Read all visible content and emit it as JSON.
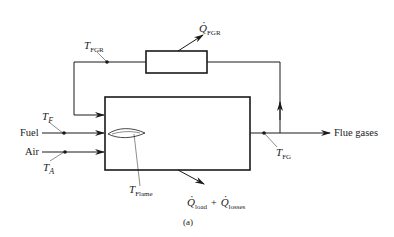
{
  "diagram": {
    "type": "process-flow",
    "caption": "(a)",
    "blocks": [
      {
        "id": "furnace",
        "label": ""
      },
      {
        "id": "fgr-heat-exchanger",
        "label": ""
      }
    ],
    "inputs": {
      "fuel": {
        "label": "Fuel",
        "temperature": {
          "symbol": "T",
          "subscript": "F"
        }
      },
      "air": {
        "label": "Air",
        "temperature": {
          "symbol": "T",
          "subscript": "A"
        }
      }
    },
    "outputs": {
      "flue": {
        "label": "Flue gases",
        "temperature": {
          "symbol": "T",
          "subscript": "FG"
        }
      }
    },
    "recirculation": {
      "temperature": {
        "symbol": "T",
        "subscript": "FGR"
      },
      "heat": {
        "symbol": "Q",
        "subscript": "FGR"
      }
    },
    "flame": {
      "temperature": {
        "symbol": "T",
        "subscript": "Flame"
      }
    },
    "heat_out": {
      "term1": {
        "symbol": "Q",
        "subscript": "load"
      },
      "plus": "+",
      "term2": {
        "symbol": "Q",
        "subscript": "losses"
      }
    },
    "colors": {
      "line": "#1a1a1a",
      "background": "#ffffff"
    }
  }
}
